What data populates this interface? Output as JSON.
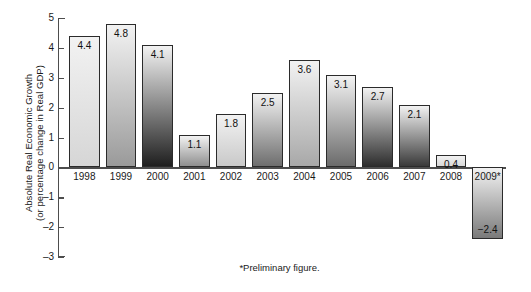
{
  "chart_data": {
    "type": "bar",
    "title": "",
    "subtitle": "",
    "xlabel": "",
    "ylabel_line1": "Absolute Real Economic Growth",
    "ylabel_line2": "(or percentage change in Real GDP)",
    "categories": [
      "1998",
      "1999",
      "2000",
      "2001",
      "2002",
      "2003",
      "2004",
      "2005",
      "2006",
      "2007",
      "2008",
      "2009*"
    ],
    "values": [
      4.4,
      4.8,
      4.1,
      1.1,
      1.8,
      2.5,
      3.6,
      3.1,
      2.7,
      2.1,
      0.4,
      -2.4
    ],
    "value_labels": [
      "4.4",
      "4.8",
      "4.1",
      "1.1",
      "1.8",
      "2.5",
      "3.6",
      "3.1",
      "2.7",
      "2.1",
      "0.4",
      "−2.4"
    ],
    "ylim": [
      -3,
      5
    ],
    "ytick_values": [
      5,
      4,
      3,
      2,
      1,
      0,
      -1,
      -2,
      -3
    ],
    "ytick_labels": [
      "5",
      "4",
      "3",
      "2",
      "1",
      "0",
      "–1",
      "–2",
      "–3"
    ],
    "grid": false,
    "legend": null,
    "annotations": [
      "*Preliminary figure."
    ],
    "bar_fill_top_color": "#f2f2f2",
    "bar_fill_bottom_colors": [
      "#d6d6d6",
      "#9a9a9a",
      "#1f1f1f",
      "#8f8f8f",
      "#c9c9c9",
      "#6e6e6e",
      "#a8a8a8",
      "#6b6b6b",
      "#2e2e2e",
      "#3a3a3a",
      "#d9d9d9",
      "#7a7a7a"
    ],
    "bar_border_color": "#2b2b2b",
    "axis_color": "#4d4d4d"
  },
  "footnote": {
    "text": "*Preliminary figure."
  }
}
